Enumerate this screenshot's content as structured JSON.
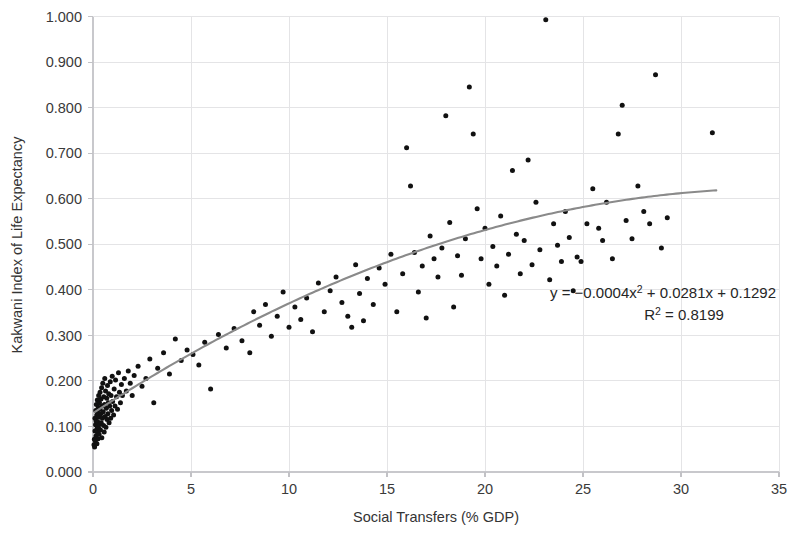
{
  "chart_data": {
    "type": "scatter",
    "title": "",
    "xlabel": "Social Transfers (% GDP)",
    "ylabel": "Kakwani Index of Life Expectancy",
    "xlim": [
      0,
      35
    ],
    "ylim": [
      0.0,
      1.0
    ],
    "xticks": [
      "0",
      "5",
      "10",
      "15",
      "20",
      "25",
      "30",
      "35"
    ],
    "xtick_values": [
      0,
      5,
      10,
      15,
      20,
      25,
      30,
      35
    ],
    "yticks": [
      "0.000",
      "0.100",
      "0.200",
      "0.300",
      "0.400",
      "0.500",
      "0.600",
      "0.700",
      "0.800",
      "0.900",
      "1.000"
    ],
    "ytick_values": [
      0.0,
      0.1,
      0.2,
      0.3,
      0.4,
      0.5,
      0.6,
      0.7,
      0.8,
      0.9,
      1.0
    ],
    "grid": true,
    "grid_axis": "both",
    "legend": false,
    "legend_position": "none",
    "marker": "filled-circle",
    "marker_color": "#111111",
    "marker_size_px": 5,
    "trendline": {
      "type": "polynomial",
      "order": 2,
      "color": "#8a8a8a",
      "equation": "y = −0.0004x² + 0.0281x + 0.1292",
      "equation_parts": {
        "prefix": "y = −0.0004x",
        "sup1": "2",
        "middle": " + 0.0281x + 0.1292"
      },
      "r2_label_prefix": "R",
      "r2_label_sup": "2",
      "r2_label_value": " = 0.8199",
      "r_squared": 0.8199,
      "coefficients": {
        "a": -0.0004,
        "b": 0.0281,
        "c": 0.1292
      },
      "x_start": 0.1,
      "x_end": 31.8
    },
    "annotations": [
      {
        "name": "trendline-equation",
        "text": "y = −0.0004x² + 0.0281x + 0.1292",
        "x": 23.8,
        "y": 0.412
      },
      {
        "name": "r-squared",
        "text": "R² = 0.8199",
        "x": 26.2,
        "y": 0.378
      }
    ],
    "points": [
      [
        0.05,
        0.06
      ],
      [
        0.07,
        0.072
      ],
      [
        0.08,
        0.055
      ],
      [
        0.1,
        0.09
      ],
      [
        0.1,
        0.118
      ],
      [
        0.12,
        0.068
      ],
      [
        0.13,
        0.104
      ],
      [
        0.14,
        0.135
      ],
      [
        0.15,
        0.079
      ],
      [
        0.16,
        0.112
      ],
      [
        0.17,
        0.148
      ],
      [
        0.18,
        0.092
      ],
      [
        0.19,
        0.125
      ],
      [
        0.2,
        0.062
      ],
      [
        0.21,
        0.1
      ],
      [
        0.22,
        0.158
      ],
      [
        0.23,
        0.086
      ],
      [
        0.24,
        0.13
      ],
      [
        0.25,
        0.11
      ],
      [
        0.26,
        0.073
      ],
      [
        0.27,
        0.142
      ],
      [
        0.28,
        0.097
      ],
      [
        0.29,
        0.168
      ],
      [
        0.3,
        0.12
      ],
      [
        0.31,
        0.083
      ],
      [
        0.33,
        0.152
      ],
      [
        0.34,
        0.105
      ],
      [
        0.35,
        0.138
      ],
      [
        0.36,
        0.175
      ],
      [
        0.38,
        0.092
      ],
      [
        0.4,
        0.128
      ],
      [
        0.41,
        0.16
      ],
      [
        0.42,
        0.108
      ],
      [
        0.44,
        0.185
      ],
      [
        0.45,
        0.075
      ],
      [
        0.47,
        0.145
      ],
      [
        0.48,
        0.118
      ],
      [
        0.5,
        0.195
      ],
      [
        0.52,
        0.132
      ],
      [
        0.54,
        0.102
      ],
      [
        0.55,
        0.165
      ],
      [
        0.57,
        0.088
      ],
      [
        0.59,
        0.148
      ],
      [
        0.6,
        0.205
      ],
      [
        0.62,
        0.122
      ],
      [
        0.64,
        0.178
      ],
      [
        0.66,
        0.098
      ],
      [
        0.68,
        0.14
      ],
      [
        0.7,
        0.162
      ],
      [
        0.72,
        0.115
      ],
      [
        0.74,
        0.19
      ],
      [
        0.76,
        0.128
      ],
      [
        0.78,
        0.152
      ],
      [
        0.8,
        0.172
      ],
      [
        0.82,
        0.108
      ],
      [
        0.85,
        0.145
      ],
      [
        0.88,
        0.198
      ],
      [
        0.9,
        0.118
      ],
      [
        0.92,
        0.168
      ],
      [
        0.95,
        0.135
      ],
      [
        0.98,
        0.21
      ],
      [
        1.0,
        0.155
      ],
      [
        1.05,
        0.125
      ],
      [
        1.08,
        0.182
      ],
      [
        1.12,
        0.145
      ],
      [
        1.15,
        0.202
      ],
      [
        1.2,
        0.165
      ],
      [
        1.25,
        0.138
      ],
      [
        1.3,
        0.218
      ],
      [
        1.35,
        0.175
      ],
      [
        1.4,
        0.152
      ],
      [
        1.45,
        0.192
      ],
      [
        1.5,
        0.168
      ],
      [
        1.6,
        0.205
      ],
      [
        1.7,
        0.178
      ],
      [
        1.8,
        0.222
      ],
      [
        1.9,
        0.195
      ],
      [
        2.0,
        0.168
      ],
      [
        2.1,
        0.212
      ],
      [
        2.3,
        0.232
      ],
      [
        2.5,
        0.188
      ],
      [
        2.7,
        0.205
      ],
      [
        2.9,
        0.248
      ],
      [
        3.1,
        0.152
      ],
      [
        3.3,
        0.228
      ],
      [
        3.6,
        0.262
      ],
      [
        3.9,
        0.215
      ],
      [
        4.2,
        0.292
      ],
      [
        4.5,
        0.245
      ],
      [
        4.8,
        0.268
      ],
      [
        5.1,
        0.258
      ],
      [
        5.4,
        0.235
      ],
      [
        5.7,
        0.285
      ],
      [
        6.0,
        0.182
      ],
      [
        6.4,
        0.302
      ],
      [
        6.8,
        0.272
      ],
      [
        7.2,
        0.315
      ],
      [
        7.6,
        0.288
      ],
      [
        8.0,
        0.262
      ],
      [
        8.2,
        0.352
      ],
      [
        8.5,
        0.322
      ],
      [
        8.8,
        0.368
      ],
      [
        9.1,
        0.298
      ],
      [
        9.4,
        0.342
      ],
      [
        9.7,
        0.395
      ],
      [
        10.0,
        0.318
      ],
      [
        10.3,
        0.362
      ],
      [
        10.6,
        0.335
      ],
      [
        10.9,
        0.382
      ],
      [
        11.2,
        0.308
      ],
      [
        11.5,
        0.415
      ],
      [
        11.8,
        0.352
      ],
      [
        12.1,
        0.398
      ],
      [
        12.4,
        0.428
      ],
      [
        12.7,
        0.372
      ],
      [
        13.0,
        0.342
      ],
      [
        13.2,
        0.318
      ],
      [
        13.4,
        0.455
      ],
      [
        13.6,
        0.392
      ],
      [
        13.8,
        0.332
      ],
      [
        14.0,
        0.425
      ],
      [
        14.3,
        0.368
      ],
      [
        14.6,
        0.448
      ],
      [
        14.9,
        0.412
      ],
      [
        15.2,
        0.478
      ],
      [
        15.5,
        0.352
      ],
      [
        15.8,
        0.435
      ],
      [
        16.0,
        0.712
      ],
      [
        16.2,
        0.628
      ],
      [
        16.4,
        0.482
      ],
      [
        16.6,
        0.395
      ],
      [
        16.8,
        0.452
      ],
      [
        17.0,
        0.338
      ],
      [
        17.2,
        0.518
      ],
      [
        17.4,
        0.468
      ],
      [
        17.6,
        0.428
      ],
      [
        17.8,
        0.492
      ],
      [
        18.0,
        0.782
      ],
      [
        18.2,
        0.548
      ],
      [
        18.4,
        0.362
      ],
      [
        18.6,
        0.475
      ],
      [
        18.8,
        0.432
      ],
      [
        19.0,
        0.512
      ],
      [
        19.2,
        0.845
      ],
      [
        19.4,
        0.742
      ],
      [
        19.6,
        0.578
      ],
      [
        19.8,
        0.468
      ],
      [
        20.0,
        0.535
      ],
      [
        20.2,
        0.412
      ],
      [
        20.4,
        0.495
      ],
      [
        20.6,
        0.452
      ],
      [
        20.8,
        0.562
      ],
      [
        21.0,
        0.388
      ],
      [
        21.2,
        0.478
      ],
      [
        21.4,
        0.662
      ],
      [
        21.6,
        0.522
      ],
      [
        21.8,
        0.435
      ],
      [
        22.0,
        0.508
      ],
      [
        22.2,
        0.685
      ],
      [
        22.4,
        0.455
      ],
      [
        22.6,
        0.592
      ],
      [
        22.8,
        0.488
      ],
      [
        23.1,
        0.993
      ],
      [
        23.3,
        0.422
      ],
      [
        23.5,
        0.545
      ],
      [
        23.7,
        0.498
      ],
      [
        23.9,
        0.462
      ],
      [
        24.1,
        0.572
      ],
      [
        24.3,
        0.515
      ],
      [
        24.5,
        0.398
      ],
      [
        24.7,
        0.472
      ],
      [
        24.9,
        0.462
      ],
      [
        25.2,
        0.545
      ],
      [
        25.5,
        0.622
      ],
      [
        25.8,
        0.535
      ],
      [
        26.0,
        0.508
      ],
      [
        26.2,
        0.592
      ],
      [
        26.5,
        0.468
      ],
      [
        26.8,
        0.742
      ],
      [
        27.0,
        0.805
      ],
      [
        27.2,
        0.552
      ],
      [
        27.5,
        0.512
      ],
      [
        27.8,
        0.628
      ],
      [
        28.1,
        0.572
      ],
      [
        28.4,
        0.545
      ],
      [
        28.7,
        0.872
      ],
      [
        29.0,
        0.492
      ],
      [
        29.3,
        0.558
      ],
      [
        31.6,
        0.745
      ]
    ],
    "point_count": 178
  }
}
